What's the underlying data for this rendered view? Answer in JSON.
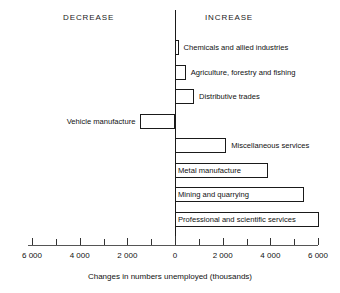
{
  "chart_data": {
    "type": "bar",
    "orientation": "horizontal",
    "title": "",
    "xlabel": "Changes in numbers unemployed (thousands)",
    "ylabel": "",
    "xlim": [
      -6000,
      6000
    ],
    "grid": false,
    "legend": "none",
    "axis_note": "Bars left of zero denote DECREASE, bars right of zero denote INCREASE",
    "tick_labels": [
      "6 000",
      "4 000",
      "2 000",
      "0",
      "2 000",
      "4 000",
      "6 000"
    ],
    "tick_values": [
      -6000,
      -4000,
      -2000,
      0,
      2000,
      4000,
      6000
    ],
    "minor_tick_values": [
      -5000,
      -3000,
      -1000,
      1000,
      3000,
      5000
    ],
    "categories": [
      "Chemicals and allied industries",
      "Agriculture, forestry and fishing",
      "Distributive trades",
      "Vehicle manufacture",
      "Miscellaneous services",
      "Metal manufacture",
      "Mining and quarrying",
      "Professional and scientific services"
    ],
    "values": [
      150,
      450,
      800,
      -1450,
      2150,
      3900,
      5400,
      6050
    ],
    "bars": [
      {
        "label": "Chemicals and allied industries",
        "value": 150,
        "direction": "increase",
        "label_position": "outside-right"
      },
      {
        "label": "Agriculture, forestry and fishing",
        "value": 450,
        "direction": "increase",
        "label_position": "outside-right"
      },
      {
        "label": "Distributive trades",
        "value": 800,
        "direction": "increase",
        "label_position": "outside-right"
      },
      {
        "label": "Vehicle manufacture",
        "value": -1450,
        "direction": "decrease",
        "label_position": "outside-left"
      },
      {
        "label": "Miscellaneous services",
        "value": 2150,
        "direction": "increase",
        "label_position": "outside-right"
      },
      {
        "label": "Metal manufacture",
        "value": 3900,
        "direction": "increase",
        "label_position": "inside"
      },
      {
        "label": "Mining and quarrying",
        "value": 5400,
        "direction": "increase",
        "label_position": "inside"
      },
      {
        "label": "Professional and scientific services",
        "value": 6050,
        "direction": "increase",
        "label_position": "inside"
      }
    ]
  },
  "headers": {
    "decrease": "DECREASE",
    "increase": "INCREASE"
  },
  "axis": {
    "title": "Changes in numbers unemployed (thousands)"
  },
  "colors": {
    "bar_fill": "#ffffff",
    "bar_stroke": "#1a1a1a",
    "axis": "#1a1a1a",
    "text": "#111111",
    "background": "#ffffff"
  }
}
